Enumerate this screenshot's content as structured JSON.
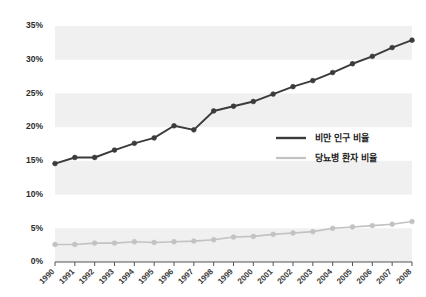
{
  "chart_data": {
    "type": "line",
    "title": "",
    "xlabel": "",
    "ylabel": "",
    "grid": false,
    "banded_background": true,
    "legend_position": "center-right",
    "x": [
      "1990",
      "1991",
      "1992",
      "1993",
      "1994",
      "1995",
      "1996",
      "1997",
      "1998",
      "1999",
      "2000",
      "2001",
      "2002",
      "2003",
      "2004",
      "2005",
      "2006",
      "2007",
      "2008"
    ],
    "categories": [
      "1990",
      "1991",
      "1992",
      "1993",
      "1994",
      "1995",
      "1996",
      "1997",
      "1998",
      "1999",
      "2000",
      "2001",
      "2002",
      "2003",
      "2004",
      "2005",
      "2006",
      "2007",
      "2008"
    ],
    "ylim": [
      0,
      35
    ],
    "ytick_values": [
      0,
      5,
      10,
      15,
      20,
      25,
      30,
      35
    ],
    "ytick_labels": [
      "0%",
      "5%",
      "10%",
      "15%",
      "20%",
      "25%",
      "30%",
      "35%"
    ],
    "series": [
      {
        "name": "비만 인구 비율",
        "color": "#3b3b3b",
        "marker": "circle",
        "values": [
          14.6,
          15.5,
          15.5,
          16.6,
          17.6,
          18.4,
          20.2,
          19.6,
          22.4,
          23.1,
          23.8,
          24.9,
          26.0,
          26.9,
          28.1,
          29.4,
          30.5,
          31.8,
          32.9
        ]
      },
      {
        "name": "당뇨병 환자 비율",
        "color": "#c2c2c2",
        "marker": "circle",
        "values": [
          2.6,
          2.6,
          2.8,
          2.8,
          3.0,
          2.9,
          3.0,
          3.1,
          3.3,
          3.7,
          3.8,
          4.1,
          4.3,
          4.5,
          5.0,
          5.2,
          5.4,
          5.6,
          6.0
        ]
      }
    ],
    "annotations": []
  },
  "legend": {
    "items": [
      {
        "label": "비만 인구 비율",
        "color": "#3b3b3b"
      },
      {
        "label": "당뇨병 환자 비율",
        "color": "#c2c2c2"
      }
    ]
  },
  "axes": {
    "y_unit": "%",
    "x_rotation": "-45"
  },
  "colors": {
    "band": "#f0f0f0",
    "background": "#ffffff",
    "axis": "#555555",
    "obesity_line": "#3b3b3b",
    "diabetes_line": "#c2c2c2"
  }
}
